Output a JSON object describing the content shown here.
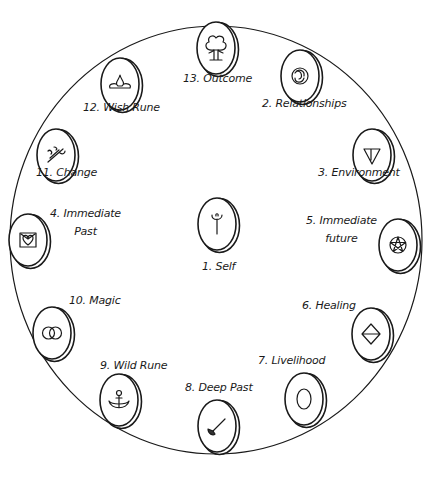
{
  "diagram": {
    "type": "rune-spread",
    "outer_circle": {
      "cx": 216,
      "cy": 240,
      "rx": 206,
      "ry": 214,
      "stroke": "#1a1a1a"
    },
    "stone_style": {
      "fill": "#ffffff",
      "stroke": "#1a1a1a"
    },
    "positions": [
      {
        "number": 1,
        "label": "1. Self",
        "symbol": "figure-rune",
        "stone": {
          "cx": 217,
          "cy": 224
        },
        "label_pos": {
          "x": 202,
          "y": 270
        }
      },
      {
        "number": 2,
        "label": "2. Relationships",
        "symbol": "triskele",
        "stone": {
          "cx": 300,
          "cy": 76
        },
        "label_pos": {
          "x": 262,
          "y": 107
        }
      },
      {
        "number": 3,
        "label": "3. Environment",
        "symbol": "triangle-down",
        "stone": {
          "cx": 372,
          "cy": 155
        },
        "label_pos": {
          "x": 318,
          "y": 176
        }
      },
      {
        "number": 4,
        "label": "4. Immediate",
        "label_line2": "Past",
        "symbol": "heart-box",
        "stone": {
          "cx": 28,
          "cy": 240
        },
        "label_pos": {
          "x": 50,
          "y": 217
        }
      },
      {
        "number": 5,
        "label": "5. Immediate",
        "label_line2": "future",
        "symbol": "pentacle",
        "stone": {
          "cx": 398,
          "cy": 245
        },
        "label_pos": {
          "x": 306,
          "y": 224
        }
      },
      {
        "number": 6,
        "label": "6. Healing",
        "symbol": "diamond",
        "stone": {
          "cx": 371,
          "cy": 334
        },
        "label_pos": {
          "x": 302,
          "y": 309
        }
      },
      {
        "number": 7,
        "label": "7. Livelihood",
        "symbol": "ring",
        "stone": {
          "cx": 304,
          "cy": 399
        },
        "label_pos": {
          "x": 258,
          "y": 364
        }
      },
      {
        "number": 8,
        "label": "8. Deep Past",
        "symbol": "broom",
        "stone": {
          "cx": 217,
          "cy": 426
        },
        "label_pos": {
          "x": 185,
          "y": 391
        }
      },
      {
        "number": 9,
        "label": "9. Wild Rune",
        "symbol": "anchor",
        "stone": {
          "cx": 119,
          "cy": 400
        },
        "label_pos": {
          "x": 100,
          "y": 369
        }
      },
      {
        "number": 10,
        "label": "10. Magic",
        "symbol": "interlocked-rings",
        "stone": {
          "cx": 52,
          "cy": 333
        },
        "label_pos": {
          "x": 69,
          "y": 304
        }
      },
      {
        "number": 11,
        "label": "11. Change",
        "symbol": "sprouting-branch",
        "stone": {
          "cx": 56,
          "cy": 155
        },
        "label_pos": {
          "x": 36,
          "y": 176
        }
      },
      {
        "number": 12,
        "label": "12. Wish Rune",
        "symbol": "flame-drop",
        "stone": {
          "cx": 120,
          "cy": 84
        },
        "label_pos": {
          "x": 83,
          "y": 111
        }
      },
      {
        "number": 13,
        "label": "13. Outcome",
        "symbol": "tree",
        "stone": {
          "cx": 216,
          "cy": 48
        },
        "label_pos": {
          "x": 183,
          "y": 82
        }
      }
    ]
  }
}
